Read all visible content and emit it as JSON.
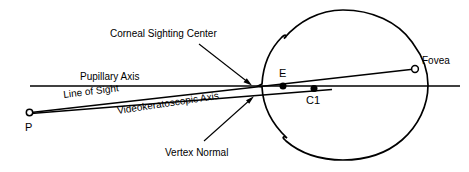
{
  "figure": {
    "type": "schematic-diagram",
    "background_color": "#ffffff",
    "stroke_color": "#000000",
    "width": 469,
    "height": 172
  },
  "labels": {
    "corneal_sighting_center": "Corneal Sighting Center",
    "pupillary_axis": "Pupillary Axis",
    "line_of_sight": "Line of Sight",
    "videokeratoscopic_axis": "Videokeratoscopic Axis",
    "vertex_normal": "Vertex Normal",
    "fovea": "Fovea",
    "point_p": "P",
    "point_e": "E",
    "point_c1": "C1"
  },
  "points": {
    "P": {
      "label": "P",
      "marker": "open-circle",
      "x": 29,
      "y": 112
    },
    "E": {
      "label": "E",
      "marker": "filled-circle",
      "x": 283,
      "y": 86
    },
    "C1": {
      "label": "C1",
      "marker": "filled-circle",
      "x": 314,
      "y": 88
    },
    "Fovea": {
      "label": "Fovea",
      "marker": "open-circle",
      "x": 415,
      "y": 69
    }
  },
  "eye": {
    "center_x": 343,
    "center_y": 85,
    "radius": 75,
    "notch_top_left": {
      "x": 285,
      "y": 35
    },
    "notch_bottom_left": {
      "x": 285,
      "y": 137
    }
  },
  "axes": [
    {
      "name": "pupillary-axis",
      "description": "horizontal line through the eye",
      "from": {
        "x": 30,
        "y": 86
      },
      "to": {
        "x": 460,
        "y": 86
      }
    },
    {
      "name": "line-of-sight",
      "description": "from fixation point P through corneal sighting center to fovea",
      "from": {
        "x": 31,
        "y": 112
      },
      "to": {
        "x": 415,
        "y": 69
      }
    },
    {
      "name": "videokeratoscopic-axis",
      "description": "from P to vertex normal on cornea continuing to C1",
      "from": {
        "x": 31,
        "y": 113
      },
      "to": {
        "x": 330,
        "y": 89
      }
    }
  ],
  "leaders": [
    {
      "name": "corneal-sighting-center-leader",
      "from": {
        "x": 200,
        "y": 45
      },
      "to": {
        "x": 252,
        "y": 85
      },
      "arrow": true
    },
    {
      "name": "vertex-normal-leader",
      "from": {
        "x": 205,
        "y": 140
      },
      "to": {
        "x": 253,
        "y": 96
      },
      "arrow": true
    }
  ]
}
